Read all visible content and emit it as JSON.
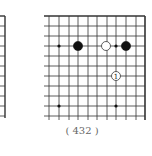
{
  "diagram": {
    "caption": "( 432 )",
    "board": {
      "columns_x": [
        49,
        59,
        69,
        78,
        88,
        97,
        107,
        116,
        126,
        136,
        145
      ],
      "rows_y": [
        16,
        26,
        36,
        46,
        56,
        66,
        76,
        86,
        96,
        106,
        116
      ],
      "bottom_extent": 120,
      "left_extent": 44,
      "edges": [
        "top",
        "right"
      ],
      "line_color": "#333333",
      "star_points": [
        [
          59,
          46
        ],
        [
          116,
          46
        ],
        [
          59,
          106
        ],
        [
          116,
          106
        ]
      ]
    },
    "stones": [
      {
        "color": "black",
        "x": 78,
        "y": 46,
        "label": ""
      },
      {
        "color": "white",
        "x": 106,
        "y": 46,
        "label": ""
      },
      {
        "color": "black",
        "x": 126,
        "y": 46,
        "label": ""
      },
      {
        "color": "white",
        "x": 116,
        "y": 76,
        "label": "1"
      }
    ],
    "left_fragment": {
      "edge_x": 5,
      "top_y": 16,
      "bottom_y": 118,
      "rows_y": [
        16,
        26,
        36,
        46,
        56,
        66,
        76,
        86,
        96,
        106,
        116
      ]
    }
  }
}
